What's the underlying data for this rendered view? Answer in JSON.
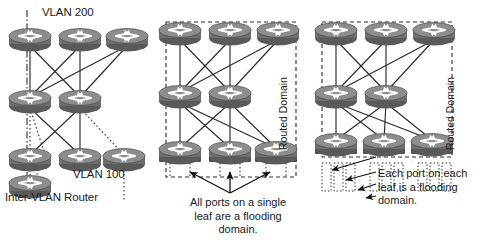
{
  "figure": {
    "type": "network-topology-diagram",
    "width": 488,
    "height": 242,
    "background": "#ffffff",
    "line_color": "#2b2b2b",
    "device_color": "#6e6e6e",
    "device_dark": "#4a4a4a",
    "device_light": "#9a9a9a"
  },
  "panels": [
    {
      "id": "vlan-panel",
      "labels": {
        "vlan_top": "VLAN 200",
        "vlan_bottom": "VLAN 100",
        "inter_vlan_router": "Inter-VLAN Router"
      },
      "tiers": [
        {
          "name": "spine",
          "count": 3
        },
        {
          "name": "aggregation",
          "count": 2
        },
        {
          "name": "leaf",
          "count": 3
        },
        {
          "name": "inter-vlan-router",
          "count": 1
        }
      ]
    },
    {
      "id": "leaf-flooding-panel",
      "domain_label": "Routed Domain",
      "caption_lines": [
        "All ports on a single",
        "leaf are a flooding",
        "domain."
      ],
      "arrow_count": 3,
      "tiers": [
        {
          "name": "spine",
          "count": 3
        },
        {
          "name": "aggregation",
          "count": 2
        },
        {
          "name": "leaf",
          "count": 3
        }
      ]
    },
    {
      "id": "port-flooding-panel",
      "domain_label": "Routed Domain",
      "caption_lines": [
        "Each port on each",
        "leaf is a flooding",
        "domain."
      ],
      "arrow_count": 4,
      "tiers": [
        {
          "name": "spine",
          "count": 3
        },
        {
          "name": "aggregation",
          "count": 2
        },
        {
          "name": "leaf",
          "count": 3
        }
      ]
    }
  ]
}
